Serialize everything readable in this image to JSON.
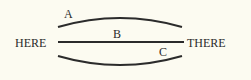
{
  "diagram": {
    "start_label": "HERE",
    "end_label": "THERE",
    "paths": [
      {
        "label": "A",
        "shape": "upward-arc"
      },
      {
        "label": "B",
        "shape": "straight"
      },
      {
        "label": "C",
        "shape": "downward-arc"
      }
    ],
    "colors": {
      "background": "#fcfbf1",
      "stroke": "#2b2b2b",
      "text": "#2b2b2b"
    }
  }
}
